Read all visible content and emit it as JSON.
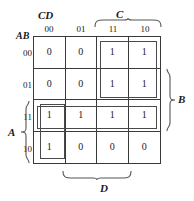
{
  "figure": {
    "type": "karnaugh-map",
    "variables_label_top": "CD",
    "variables_label_left": "AB"
  },
  "headers": {
    "columns": [
      "00",
      "01",
      "11",
      "10"
    ],
    "rows": [
      "00",
      "01",
      "11",
      "10"
    ]
  },
  "grid": {
    "values": [
      [
        "0",
        "0",
        "1",
        "1"
      ],
      [
        "0",
        "0",
        "1",
        "1"
      ],
      [
        "1",
        "1",
        "1",
        "1"
      ],
      [
        "1",
        "0",
        "0",
        "0"
      ]
    ]
  },
  "braces": {
    "c": "C",
    "d": "D",
    "b": "B",
    "a": "A"
  },
  "colors": {
    "grid_line": "#3a3a3a",
    "group_box": "#4a4a4a",
    "text": "#1a1a1a",
    "background": "#ffffff"
  }
}
